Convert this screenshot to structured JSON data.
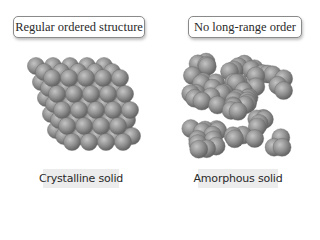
{
  "labels": {
    "left_box": "Regular ordered structure",
    "right_box": "No long-range order",
    "left_caption": "Crystalline solid",
    "right_caption": "Amorphous solid"
  },
  "colors": {
    "sphere_light": "#bdbdbd",
    "sphere_mid": "#8c8c8c",
    "sphere_dark": "#5a5a5a",
    "caption_bg": "#ececec",
    "box_border": "#8a8a8a"
  }
}
